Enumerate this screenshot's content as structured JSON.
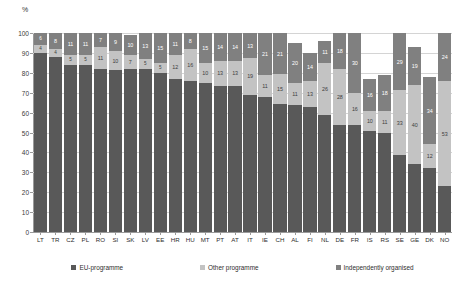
{
  "chart": {
    "unit": "%",
    "ylabel": "",
    "xlabel": ""
  },
  "legend": {
    "items": [
      {
        "label": "EU-programme",
        "color": "#595959",
        "key": "eu"
      },
      {
        "label": "Other programme",
        "color": "#c3c3c3",
        "key": "other"
      },
      {
        "label": "Independently organised",
        "color": "#808080",
        "key": "indep"
      }
    ]
  },
  "yaxis": {
    "ticks": [
      "100",
      "90",
      "80",
      "70",
      "60",
      "50",
      "40",
      "30",
      "20",
      "10",
      "0"
    ],
    "min": 0,
    "max": 100
  },
  "chart_data": {
    "type": "bar",
    "stacked": true,
    "title": "",
    "subtitle": "",
    "xlabel": "",
    "ylabel": "%",
    "ylim": [
      0,
      100
    ],
    "grid": true,
    "legend_position": "bottom",
    "categories": [
      "LT",
      "TR",
      "CZ",
      "PL",
      "RO",
      "SI",
      "SK",
      "LV",
      "EE",
      "HR",
      "HU",
      "MT",
      "PT",
      "AT",
      "IT",
      "IE",
      "CH",
      "AL",
      "FI",
      "NL",
      "DE",
      "FR",
      "IS",
      "RS",
      "SE",
      "GE",
      "DK",
      "NO"
    ],
    "series": [
      {
        "name": "EU-programme",
        "color": "#595959",
        "values": [
          90,
          88,
          84,
          84,
          82,
          82,
          82,
          82,
          80,
          77,
          76,
          75,
          74,
          74,
          71,
          68,
          65,
          64,
          63,
          59,
          54,
          54,
          51,
          50,
          39,
          34,
          32,
          23
        ]
      },
      {
        "name": "Other programme",
        "color": "#c3c3c3",
        "values": [
          4,
          4,
          5,
          5,
          11,
          10,
          7,
          5,
          5,
          12,
          16,
          10,
          13,
          13,
          19,
          11,
          15,
          11,
          13,
          26,
          28,
          16,
          10,
          11,
          33,
          40,
          12,
          53
        ]
      },
      {
        "name": "Independently organised",
        "color": "#808080",
        "values": [
          6,
          8,
          11,
          11,
          7,
          9,
          10,
          13,
          15,
          11,
          8,
          15,
          14,
          14,
          13,
          21,
          21,
          20,
          14,
          11,
          18,
          30,
          16,
          18,
          29,
          19,
          34,
          24
        ]
      }
    ],
    "series_labels": {
      "eu": [
        "",
        "",
        "",
        "",
        "",
        "",
        "",
        "",
        "",
        "",
        "",
        "",
        "",
        "",
        "",
        "",
        "",
        "",
        "",
        "",
        "",
        "",
        "",
        "",
        "",
        "",
        "",
        ""
      ],
      "other": [
        "4",
        "4",
        "5",
        "5",
        "11",
        "10",
        "7",
        "5",
        "5",
        "12",
        "16",
        "10",
        "13",
        "13",
        "19",
        "11",
        "15",
        "11",
        "13",
        "26",
        "28",
        "16",
        "10",
        "11",
        "33",
        "40",
        "12",
        "53"
      ],
      "indep": [
        "6",
        "8",
        "11",
        "11",
        "7",
        "9",
        "10",
        "13",
        "15",
        "11",
        "8",
        "15",
        "14",
        "14",
        "13",
        "21",
        "21",
        "20",
        "14",
        "11",
        "18",
        "30",
        "16",
        "18",
        "29",
        "19",
        "34",
        "24"
      ]
    },
    "axis_value_labels": [
      "43",
      "54",
      "44",
      "",
      "45",
      "54",
      "42",
      "48",
      "42",
      "46",
      "44",
      "44",
      "38",
      "44",
      "45",
      "43",
      "44",
      "44",
      "44",
      "44",
      "42",
      "41",
      "40",
      "42",
      "39",
      "41",
      "40",
      ""
    ]
  }
}
